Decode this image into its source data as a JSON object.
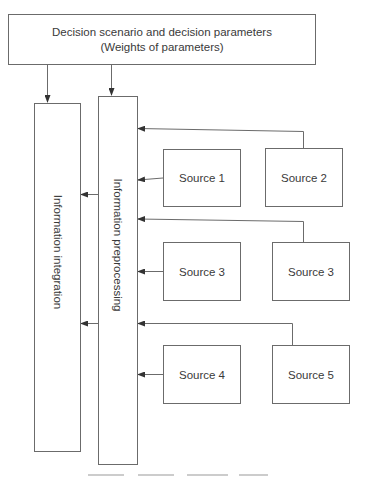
{
  "diagram": {
    "top_box": {
      "label": "Decision scenario and decision parameters (Weights of parameters)"
    },
    "columns": [
      {
        "id": "integration",
        "label": "Information integration"
      },
      {
        "id": "preprocessing",
        "label": "Information preprocessing"
      }
    ],
    "sources": [
      {
        "id": "source-1",
        "label": "Source 1"
      },
      {
        "id": "source-2",
        "label": "Source 2"
      },
      {
        "id": "source-3a",
        "label": "Source 3"
      },
      {
        "id": "source-3b",
        "label": "Source 3"
      },
      {
        "id": "source-4",
        "label": "Source 4"
      },
      {
        "id": "source-5",
        "label": "Source 5"
      }
    ],
    "edges": [
      {
        "from": "top_box",
        "to": "integration"
      },
      {
        "from": "top_box",
        "to": "preprocessing"
      },
      {
        "from": "source-2",
        "to": "preprocessing"
      },
      {
        "from": "source-1",
        "to": "preprocessing"
      },
      {
        "from": "source-3b",
        "to": "preprocessing"
      },
      {
        "from": "source-3a",
        "to": "preprocessing"
      },
      {
        "from": "source-5",
        "to": "preprocessing"
      },
      {
        "from": "source-4",
        "to": "preprocessing"
      },
      {
        "from": "preprocessing",
        "to": "integration"
      },
      {
        "from": "preprocessing",
        "to": "integration"
      }
    ],
    "colors": {
      "stroke": "#6b6b6b",
      "text": "#3a3a3a",
      "background": "#ffffff"
    }
  }
}
